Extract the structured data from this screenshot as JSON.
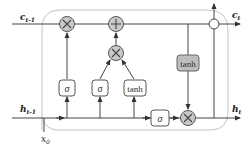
{
  "diagram": {
    "colors": {
      "line": "#444444",
      "cell_border": "#bdbdbd",
      "op_fill": "#c8c8c8",
      "gate_fill": "#ffffff",
      "tanh_out_fill": "#bdbdbd"
    },
    "labels": {
      "c_prev_main": "c",
      "c_prev_sub": "t-1",
      "c_next_main": "c",
      "c_next_sub": "t",
      "h_prev_main": "h",
      "h_prev_sub": "t-1",
      "h_next_main": "h",
      "h_next_sub": "t",
      "x_main": "x",
      "x_sub": "0"
    },
    "gates": [
      {
        "id": "forget-gate",
        "label": "σ"
      },
      {
        "id": "input-gate",
        "label": "σ"
      },
      {
        "id": "candidate",
        "label": "tanh"
      },
      {
        "id": "output-gate",
        "label": "σ"
      },
      {
        "id": "cell-tanh",
        "label": "tanh"
      }
    ],
    "operators": [
      {
        "id": "forget-multiply",
        "symbol": "×"
      },
      {
        "id": "cell-add",
        "symbol": "+"
      },
      {
        "id": "input-multiply",
        "symbol": "×"
      },
      {
        "id": "output-multiply",
        "symbol": "×"
      },
      {
        "id": "output-junction",
        "symbol": "+"
      }
    ]
  }
}
